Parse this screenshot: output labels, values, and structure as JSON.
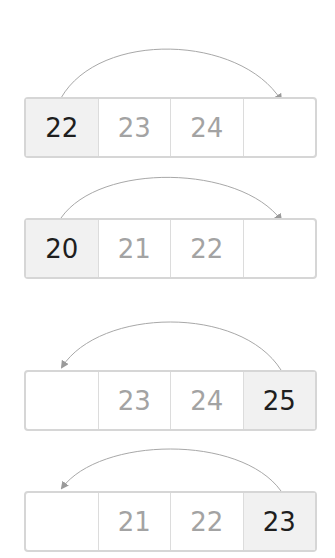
{
  "colors": {
    "border": "#d6d6d6",
    "highlight_bg": "#f1f1f1",
    "active_text": "#1e1e1e",
    "muted_text": "#a3a3a3",
    "arrow": "#9a9a9a"
  },
  "rows": [
    {
      "direction": "right",
      "cells": [
        "22",
        "23",
        "24",
        ""
      ],
      "active_index": 0
    },
    {
      "direction": "right",
      "cells": [
        "20",
        "21",
        "22",
        ""
      ],
      "active_index": 0
    },
    {
      "direction": "left",
      "cells": [
        "",
        "23",
        "24",
        "25"
      ],
      "active_index": 3
    },
    {
      "direction": "left",
      "cells": [
        "",
        "21",
        "22",
        "23"
      ],
      "active_index": 3
    }
  ]
}
